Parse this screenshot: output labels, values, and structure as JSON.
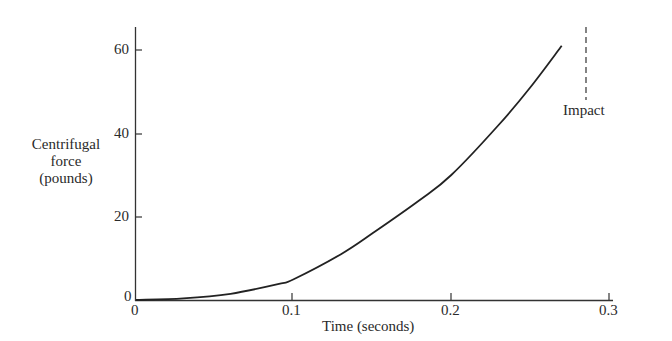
{
  "chart_data": {
    "type": "line",
    "title": "",
    "xlabel": "Time (seconds)",
    "ylabel": "Centrifugal force (pounds)",
    "ylabel_lines": [
      "Centrifugal",
      "force",
      "(pounds)"
    ],
    "xlim": [
      0,
      0.3
    ],
    "ylim": [
      0,
      65
    ],
    "x_ticks": [
      "0",
      "0.1",
      "0.2",
      "0.3"
    ],
    "y_ticks": [
      "0",
      "20",
      "40",
      "60"
    ],
    "grid": false,
    "legend": null,
    "series": [
      {
        "name": "Centrifugal force",
        "x": [
          0,
          0.03,
          0.06,
          0.09,
          0.1,
          0.13,
          0.15,
          0.18,
          0.2,
          0.23,
          0.25,
          0.27
        ],
        "y": [
          0,
          0.4,
          1.5,
          3.8,
          5,
          11,
          16,
          24,
          30,
          42,
          51,
          61
        ]
      }
    ],
    "annotations": [
      {
        "text": "Impact",
        "x": 0.27,
        "style": "dashed vertical line"
      }
    ]
  }
}
